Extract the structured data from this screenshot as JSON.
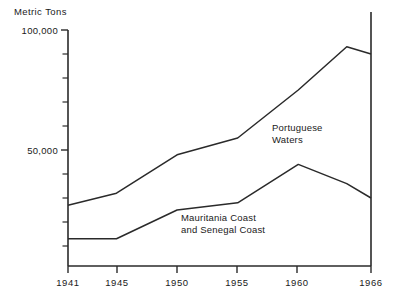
{
  "chart_data": {
    "type": "line",
    "title": "",
    "subtitle": "",
    "xlabel": "",
    "ylabel": "Metric Tons",
    "x": [
      1941,
      1945,
      1950,
      1955,
      1960,
      1964,
      1966
    ],
    "xlim": [
      1941,
      1966
    ],
    "ylim": [
      0,
      105000
    ],
    "grid": false,
    "legend_position": "inline-annotation",
    "x_tick_labels": [
      "1941",
      "1945",
      "1950",
      "1955",
      "1960",
      "1966"
    ],
    "x_tick_values": [
      1941,
      1945,
      1950,
      1955,
      1960,
      1966
    ],
    "y_tick_labels": [
      "100,000",
      "50,000"
    ],
    "y_tick_values": [
      100000,
      50000
    ],
    "y_minor_tick_values": [
      90000,
      80000,
      70000,
      60000,
      40000,
      30000,
      20000,
      10000
    ],
    "series": [
      {
        "name": "Portuguese Waters",
        "annotation": [
          "Portuguese",
          "Waters"
        ],
        "values": [
          27000,
          32000,
          48000,
          55000,
          75000,
          93000,
          90000
        ]
      },
      {
        "name": "Mauritania Coast and Senegal Coast",
        "annotation": [
          "Mauritania Coast",
          "and  Senegal Coast"
        ],
        "values": [
          13000,
          13000,
          25000,
          28000,
          44000,
          36000,
          30000
        ]
      }
    ],
    "colors": {
      "line": "#2a2a2a",
      "axis": "#2a2a2a",
      "text": "#1a1a1a",
      "background": "#ffffff"
    }
  },
  "labels": {
    "y_axis_title": "Metric Tons",
    "y_top": "100,000",
    "y_mid": "50,000",
    "x_1941": "1941",
    "x_1945": "1945",
    "x_1950": "1950",
    "x_1955": "1955",
    "x_1960": "1960",
    "x_1966": "1966",
    "ann_portuguese_line1": "Portuguese",
    "ann_portuguese_line2": "Waters",
    "ann_mauritania_line1": "Mauritania Coast",
    "ann_mauritania_line2": "and  Senegal Coast"
  }
}
